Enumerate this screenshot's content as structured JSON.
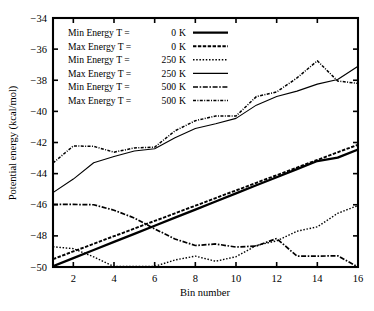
{
  "chart_data": {
    "type": "line",
    "title": "",
    "xlabel": "Bin number",
    "ylabel": "Potential energy (kcal/mol)",
    "xlim": [
      1,
      16
    ],
    "ylim": [
      -50,
      -34
    ],
    "xticks": [
      2,
      4,
      6,
      8,
      10,
      12,
      14,
      16
    ],
    "xtick_labels": [
      "2",
      "4",
      "6",
      "8",
      "10",
      "12",
      "14",
      "16"
    ],
    "yticks": [
      -34,
      -36,
      -38,
      -40,
      -42,
      -44,
      -46,
      -48,
      -50
    ],
    "ytick_labels": [
      "-34",
      "-36",
      "-38",
      "-40",
      "-42",
      "-44",
      "-46",
      "-48",
      "-50"
    ],
    "grid": false,
    "legend_position": "upper left",
    "x": [
      1,
      2,
      3,
      4,
      5,
      6,
      7,
      8,
      9,
      10,
      11,
      12,
      13,
      14,
      15,
      16
    ],
    "series": [
      {
        "name": "Min Energy T =   0 K",
        "label_text": "Min Energy T =",
        "label_temp": "0",
        "label_unit": "K",
        "style": "solid-thick",
        "values": [
          -49.95,
          -49.43,
          -48.91,
          -48.39,
          -47.87,
          -47.35,
          -46.83,
          -46.31,
          -45.79,
          -45.27,
          -44.75,
          -44.23,
          -43.71,
          -43.19,
          -42.97,
          -42.45
        ]
      },
      {
        "name": "Max Energy T =   0 K",
        "label_text": "Max Energy T =",
        "label_temp": "0",
        "label_unit": "K",
        "style": "dashed-medium",
        "values": [
          -49.5,
          -49.0,
          -48.51,
          -48.02,
          -47.53,
          -47.04,
          -46.55,
          -46.06,
          -45.57,
          -45.08,
          -44.59,
          -44.1,
          -43.61,
          -43.12,
          -42.63,
          -42.14
        ]
      },
      {
        "name": "Min Energy T = 250 K",
        "label_text": "Min Energy T =",
        "label_temp": "250",
        "label_unit": "K",
        "style": "dotted-fine",
        "values": [
          -48.7,
          -48.82,
          -49.35,
          -49.97,
          -49.96,
          -49.96,
          -49.55,
          -49.3,
          -49.63,
          -49.34,
          -48.62,
          -48.32,
          -47.7,
          -47.42,
          -46.55,
          -46.05
        ]
      },
      {
        "name": "Max Energy T = 250 K",
        "label_text": "Max Energy T =",
        "label_temp": "250",
        "label_unit": "K",
        "style": "solid-thin",
        "values": [
          -45.22,
          -44.35,
          -43.3,
          -42.9,
          -42.55,
          -42.4,
          -41.7,
          -41.1,
          -40.8,
          -40.45,
          -39.6,
          -39.05,
          -38.7,
          -38.25,
          -37.95,
          -37.1
        ]
      },
      {
        "name": "Min Energy T = 500 K",
        "label_text": "Min Energy T =",
        "label_temp": "500",
        "label_unit": "K",
        "style": "dashdot-coarse",
        "values": [
          -45.98,
          -45.98,
          -46.0,
          -46.35,
          -46.85,
          -47.55,
          -48.2,
          -48.62,
          -48.52,
          -48.72,
          -48.65,
          -48.17,
          -49.3,
          -49.3,
          -49.28,
          -50.0
        ]
      },
      {
        "name": "Max Energy T = 500 K",
        "label_text": "Max Energy T =",
        "label_temp": "500",
        "label_unit": "K",
        "style": "dashdot-fine",
        "values": [
          -43.32,
          -42.22,
          -42.25,
          -42.62,
          -42.35,
          -42.3,
          -41.25,
          -40.6,
          -40.3,
          -40.3,
          -39.05,
          -38.75,
          -37.85,
          -36.75,
          -38.05,
          -38.2
        ]
      }
    ]
  },
  "legend": {
    "items": [
      {
        "text": "Min Energy T =",
        "temp": "0",
        "unit": "K",
        "style": "solid-thick"
      },
      {
        "text": "Max Energy T =",
        "temp": "0",
        "unit": "K",
        "style": "dashed-medium"
      },
      {
        "text": "Min Energy T =",
        "temp": "250",
        "unit": "K",
        "style": "dotted-fine"
      },
      {
        "text": "Max Energy T =",
        "temp": "250",
        "unit": "K",
        "style": "solid-thin"
      },
      {
        "text": "Min Energy T =",
        "temp": "500",
        "unit": "K",
        "style": "dashdot-coarse"
      },
      {
        "text": "Max Energy T =",
        "temp": "500",
        "unit": "K",
        "style": "dashdot-fine"
      }
    ]
  },
  "colors": {
    "axis": "#000000",
    "series": "#000000",
    "background": "#ffffff"
  }
}
